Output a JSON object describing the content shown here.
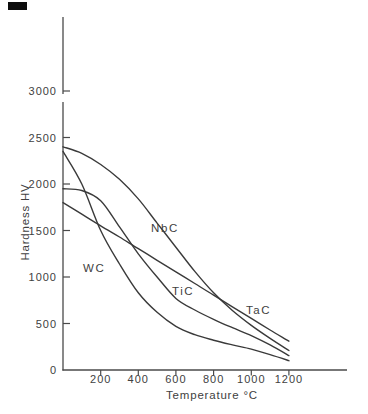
{
  "figure": {
    "background": "#ffffff",
    "ink_color": "#3a3a3a",
    "axis_color": "#4a4a4a",
    "text_color": "#414141",
    "scan_artifact": "black-rectangle-top-left"
  },
  "chart_data": {
    "type": "line",
    "title": "",
    "xlabel": "Temperature °C",
    "ylabel": "Hardness  HV",
    "x_ticks": [
      200,
      400,
      600,
      800,
      1000,
      1200
    ],
    "y_ticks": [
      0,
      500,
      1000,
      1500,
      2000,
      2500,
      3000
    ],
    "xlim": [
      0,
      1500
    ],
    "ylim": [
      0,
      3000
    ],
    "axis_break": "y-axis broken above 3000, axis continues unlabeled",
    "grid": false,
    "legend_position": "inline-curve-labels",
    "x": [
      0,
      100,
      200,
      300,
      400,
      500,
      600,
      700,
      800,
      900,
      1000,
      1100,
      1200
    ],
    "series": [
      {
        "name": "NbC",
        "values": [
          2400,
          2330,
          2210,
          2050,
          1840,
          1580,
          1320,
          1060,
          830,
          640,
          480,
          340,
          210
        ]
      },
      {
        "name": "TaC",
        "values": [
          1800,
          1675,
          1550,
          1430,
          1305,
          1180,
          1055,
          930,
          805,
          680,
          555,
          430,
          310
        ]
      },
      {
        "name": "TiC",
        "values": [
          1950,
          1930,
          1820,
          1540,
          1250,
          1000,
          770,
          645,
          545,
          455,
          370,
          270,
          155
        ]
      },
      {
        "name": "WC",
        "values": [
          2350,
          2000,
          1500,
          1140,
          830,
          620,
          470,
          380,
          320,
          270,
          225,
          165,
          100
        ]
      }
    ],
    "annotations": [
      {
        "text": "NbC",
        "near": "NbC curve, ~480 °C"
      },
      {
        "text": "WC",
        "near": "WC curve, ~160 °C"
      },
      {
        "text": "TiC",
        "near": "TiC curve, ~600 °C"
      },
      {
        "text": "TaC",
        "near": "TaC/NbC crossing, ~960 °C"
      }
    ]
  }
}
